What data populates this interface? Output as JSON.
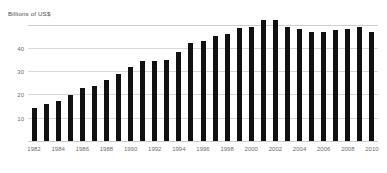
{
  "chart_data": {
    "type": "bar",
    "title": "Billions of US$",
    "xlabel": "",
    "ylabel": "Billions of US$",
    "ylim": [
      0,
      55
    ],
    "yticks": [
      10,
      20,
      30,
      40
    ],
    "gridlines": [
      10,
      20,
      30,
      40,
      50
    ],
    "grid": true,
    "legend": "none",
    "bar_color": "#111111",
    "grid_color": "#d8d8d8",
    "axis_label_color": "#6b6b6b",
    "categories": [
      "1982",
      "1983",
      "1984",
      "1985",
      "1986",
      "1987",
      "1988",
      "1989",
      "1990",
      "1991",
      "1992",
      "1993",
      "1994",
      "1995",
      "1996",
      "1997",
      "1998",
      "1999",
      "2000",
      "2001",
      "2002",
      "2003",
      "2004",
      "2005",
      "2006",
      "2007",
      "2008",
      "2009",
      "2010"
    ],
    "tick_labels": [
      "1982",
      "1984",
      "1986",
      "1988",
      "1990",
      "1992",
      "1994",
      "1996",
      "1998",
      "2000",
      "2002",
      "2004",
      "2006",
      "2008",
      "2010"
    ],
    "values": [
      14.7,
      16.2,
      17.6,
      20.4,
      23.0,
      24.1,
      26.8,
      29.2,
      32.1,
      34.9,
      34.9,
      35.3,
      38.5,
      42.5,
      43.4,
      45.6,
      46.6,
      48.8,
      49.6,
      52.5,
      52.5,
      49.4,
      48.4,
      47.2,
      47.2,
      48.2,
      48.7,
      49.3,
      47.2
    ]
  }
}
